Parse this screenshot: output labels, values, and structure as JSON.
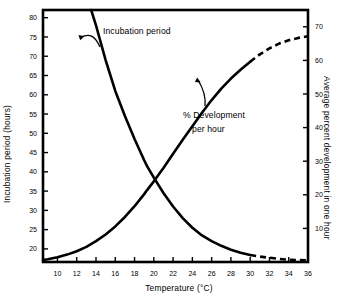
{
  "chart_data": {
    "type": "line",
    "title": "",
    "xlabel": "Temperature (°C)",
    "ylabel": "Incubation period (hours)",
    "y2label": "Average percent development in one hour",
    "xlim": [
      8.5,
      36.0
    ],
    "ylim": [
      16.6,
      82.0
    ],
    "y2lim": [
      0.0,
      75.0
    ],
    "xticks": [
      10,
      12,
      14,
      16,
      18,
      20,
      22,
      24,
      26,
      28,
      30,
      32,
      34,
      36
    ],
    "yticks": [
      20,
      25,
      30,
      35,
      40,
      45,
      50,
      55,
      60,
      65,
      70,
      75,
      80
    ],
    "y2ticks": [
      10,
      20,
      30,
      40,
      50,
      60,
      70
    ],
    "grid": false,
    "legend": "none",
    "annotations": [
      {
        "text": "Incubation period",
        "target_series": "Incubation period",
        "x": 14.9,
        "y": 70.0
      },
      {
        "text": "% Development\nper hour",
        "target_series": "% Development per hour",
        "x": 25.6,
        "y": 58.5
      }
    ],
    "series": [
      {
        "name": "Incubation period",
        "axis": "left",
        "units": "hours",
        "linestyle": "solid-then-dashed",
        "dash_starts_at_x": 30.0,
        "x": [
          13.5,
          14.0,
          14.5,
          15.0,
          15.5,
          16.0,
          17.0,
          18.0,
          19.0,
          19.3,
          20.0,
          21.0,
          22.0,
          23.0,
          24.0,
          25.0,
          26.0,
          27.0,
          28.0,
          29.0,
          30.0,
          31.0,
          32.0,
          33.0,
          34.0,
          35.0,
          36.0
        ],
        "values": [
          82.0,
          78.0,
          73.5,
          69.0,
          65.0,
          61.0,
          54.5,
          48.5,
          43.0,
          41.5,
          38.5,
          34.5,
          31.0,
          28.0,
          25.5,
          23.5,
          22.0,
          20.8,
          19.8,
          19.0,
          18.4,
          18.0,
          17.7,
          17.4,
          17.2,
          17.1,
          17.0
        ]
      },
      {
        "name": "% Development per hour",
        "axis": "right",
        "units": "percent per hour",
        "linestyle": "solid-then-dashed",
        "dash_starts_at_x": 30.0,
        "x": [
          8.5,
          9.0,
          10.0,
          11.0,
          12.0,
          13.0,
          14.0,
          15.0,
          16.0,
          17.0,
          18.0,
          19.0,
          19.3,
          20.0,
          21.0,
          22.0,
          23.0,
          24.0,
          25.0,
          26.0,
          27.0,
          28.0,
          29.0,
          30.0,
          31.0,
          32.0,
          33.0,
          34.0,
          35.0,
          36.0
        ],
        "values": [
          0.6,
          0.8,
          1.4,
          2.2,
          3.2,
          4.5,
          6.2,
          8.2,
          10.6,
          13.4,
          16.6,
          20.2,
          21.4,
          24.0,
          28.0,
          32.2,
          36.4,
          40.4,
          44.4,
          48.2,
          51.6,
          54.6,
          57.2,
          59.6,
          61.8,
          63.6,
          65.0,
          66.0,
          66.7,
          67.2
        ]
      }
    ]
  },
  "left_axis": {
    "title": "Incubation period (hours)"
  },
  "right_axis": {
    "title": "Average percent development in one hour"
  },
  "x_axis": {
    "title": "Temperature (°C)"
  },
  "labels": {
    "incubation": "Incubation period",
    "development_line1": "% Development",
    "development_line2": "per hour"
  }
}
